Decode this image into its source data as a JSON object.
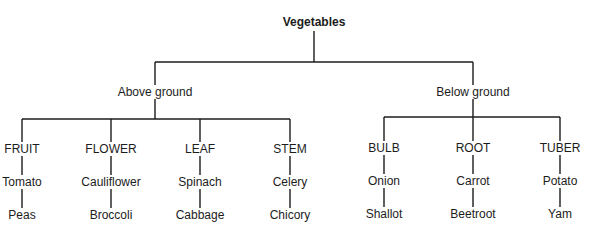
{
  "diagram": {
    "type": "tree",
    "title": "Vegetables",
    "root": {
      "label": "Vegetables",
      "children": [
        {
          "label": "Above ground",
          "children": [
            {
              "label": "FRUIT",
              "examples": [
                "Tomato",
                "Peas"
              ]
            },
            {
              "label": "FLOWER",
              "examples": [
                "Cauliflower",
                "Broccoli"
              ]
            },
            {
              "label": "LEAF",
              "examples": [
                "Spinach",
                "Cabbage"
              ]
            },
            {
              "label": "STEM",
              "examples": [
                "Celery",
                "Chicory"
              ]
            }
          ]
        },
        {
          "label": "Below ground",
          "children": [
            {
              "label": "BULB",
              "examples": [
                "Onion",
                "Shallot"
              ]
            },
            {
              "label": "ROOT",
              "examples": [
                "Carrot",
                "Beetroot"
              ]
            },
            {
              "label": "TUBER",
              "examples": [
                "Potato",
                "Yam"
              ]
            }
          ]
        }
      ]
    }
  },
  "colors": {
    "line": "#1c1c1c",
    "text": "#1c1c1c",
    "background": "#ffffff"
  }
}
